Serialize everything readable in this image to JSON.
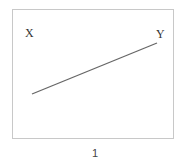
{
  "diagram": {
    "points": [
      {
        "label": "X"
      },
      {
        "label": "Y"
      }
    ],
    "segment": {
      "from": "X",
      "to": "Y",
      "color": "#666666"
    },
    "caption": "1"
  }
}
